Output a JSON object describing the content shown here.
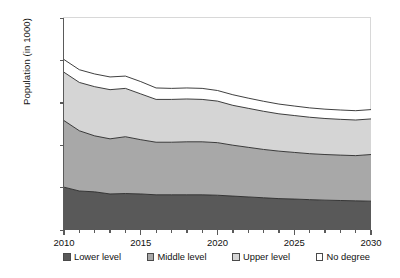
{
  "chart_data": {
    "type": "area",
    "stacked": true,
    "title": "",
    "subtitle": "",
    "xlabel": "",
    "ylabel": "Population (in 1000)",
    "xlim": [
      2010,
      2030
    ],
    "ylim": [
      0,
      2500
    ],
    "ytick_values": [
      0,
      500,
      1000,
      1500,
      2000,
      2500
    ],
    "ytick_labels": [
      "0",
      "500",
      "1000",
      "1500",
      "2000",
      "2500"
    ],
    "xtick_values": [
      2010,
      2015,
      2020,
      2025,
      2030
    ],
    "xtick_labels": [
      "2010",
      "2015",
      "2020",
      "2025",
      "2030"
    ],
    "xtick_minor_step": 1,
    "grid": false,
    "legend_position": "below",
    "x": [
      2010,
      2011,
      2012,
      2013,
      2014,
      2015,
      2016,
      2017,
      2018,
      2019,
      2020,
      2021,
      2022,
      2023,
      2024,
      2025,
      2026,
      2027,
      2028,
      2029,
      2030
    ],
    "series": [
      {
        "name": "Lower level",
        "color": "#595959",
        "values": [
          505,
          460,
          450,
          425,
          430,
          425,
          415,
          415,
          415,
          415,
          410,
          400,
          390,
          380,
          370,
          365,
          358,
          352,
          348,
          344,
          340
        ]
      },
      {
        "name": "Middle level",
        "color": "#a8a8a8",
        "values": [
          785,
          710,
          660,
          650,
          670,
          640,
          620,
          620,
          625,
          625,
          620,
          600,
          585,
          570,
          560,
          550,
          542,
          538,
          535,
          533,
          550
        ]
      },
      {
        "name": "Upper level",
        "color": "#d5d5d5",
        "values": [
          570,
          570,
          580,
          580,
          570,
          540,
          505,
          505,
          505,
          500,
          490,
          470,
          460,
          450,
          440,
          435,
          430,
          425,
          422,
          420,
          420
        ]
      },
      {
        "name": "No degree",
        "color": "#ffffff",
        "values": [
          150,
          150,
          150,
          150,
          145,
          145,
          135,
          130,
          130,
          130,
          125,
          125,
          120,
          118,
          115,
          112,
          110,
          110,
          110,
          110,
          110
        ]
      }
    ],
    "cumulative_tops": {
      "lower": [
        505,
        460,
        450,
        425,
        430,
        425,
        415,
        415,
        415,
        415,
        410,
        400,
        390,
        380,
        370,
        365,
        358,
        352,
        348,
        344,
        340
      ],
      "middle": [
        1290,
        1170,
        1110,
        1075,
        1100,
        1065,
        1035,
        1035,
        1040,
        1040,
        1030,
        1000,
        975,
        950,
        930,
        915,
        900,
        890,
        883,
        877,
        890
      ],
      "upper": [
        1860,
        1740,
        1690,
        1655,
        1670,
        1605,
        1540,
        1540,
        1545,
        1540,
        1520,
        1470,
        1435,
        1400,
        1370,
        1350,
        1330,
        1315,
        1305,
        1297,
        1310
      ],
      "nodegree": [
        2010,
        1890,
        1840,
        1805,
        1815,
        1750,
        1675,
        1670,
        1675,
        1670,
        1645,
        1595,
        1555,
        1518,
        1485,
        1462,
        1440,
        1425,
        1415,
        1407,
        1420
      ]
    },
    "legend": [
      {
        "label": "Lower level",
        "color": "#595959"
      },
      {
        "label": "Middle level",
        "color": "#a8a8a8"
      },
      {
        "label": "Upper level",
        "color": "#d5d5d5"
      },
      {
        "label": "No degree",
        "color": "#ffffff"
      }
    ],
    "colors": {
      "axis": "#5a5a5a",
      "band_outline": "#2a2a2a",
      "background": "#ffffff"
    }
  }
}
